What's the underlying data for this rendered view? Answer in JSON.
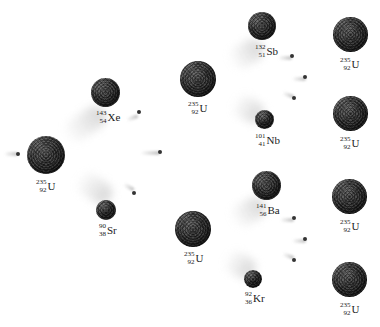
{
  "diagram": {
    "title": "",
    "colors": {
      "background": "#ffffff",
      "nucleus": "#333333",
      "neutron": "#333333",
      "trail": "#b4b4b4",
      "text": "#222222"
    },
    "nuclei": {
      "u_initial": {
        "mass": "235",
        "atomic": "92",
        "symbol": "U"
      },
      "xe": {
        "mass": "143",
        "atomic": "54",
        "symbol": "Xe"
      },
      "sr": {
        "mass": "90",
        "atomic": "38",
        "symbol": "Sr"
      },
      "u_mid_top": {
        "mass": "235",
        "atomic": "92",
        "symbol": "U"
      },
      "u_mid_bot": {
        "mass": "235",
        "atomic": "92",
        "symbol": "U"
      },
      "sb": {
        "mass": "132",
        "atomic": "51",
        "symbol": "Sb"
      },
      "nb": {
        "mass": "101",
        "atomic": "41",
        "symbol": "Nb"
      },
      "ba": {
        "mass": "141",
        "atomic": "56",
        "symbol": "Ba"
      },
      "kr": {
        "mass": "92",
        "atomic": "36",
        "symbol": "Kr"
      },
      "u_right_1": {
        "mass": "235",
        "atomic": "92",
        "symbol": "U"
      },
      "u_right_2": {
        "mass": "235",
        "atomic": "92",
        "symbol": "U"
      },
      "u_right_3": {
        "mass": "235",
        "atomic": "92",
        "symbol": "U"
      },
      "u_right_4": {
        "mass": "235",
        "atomic": "92",
        "symbol": "U"
      }
    },
    "neutron_count": 9,
    "stages": [
      "Neutron strikes U-235",
      "U-235 splits into Xe-143 + Sr-90 releasing neutrons",
      "Neutrons strike two more U-235 nuclei",
      "Those split into Sb-132 + Nb-101 and Ba-141 + Kr-92",
      "Released neutrons strike four further U-235 nuclei"
    ]
  }
}
